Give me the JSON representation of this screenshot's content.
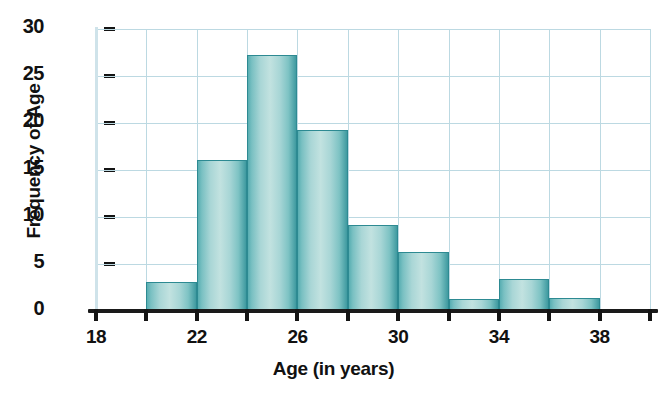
{
  "chart_data": {
    "type": "bar",
    "title": "",
    "subtitle": "",
    "xlabel": "Age (in years)",
    "ylabel": "Frequency of Age",
    "categories": [
      "20-22",
      "22-24",
      "24-26",
      "26-28",
      "28-30",
      "30-32",
      "32-34",
      "34-36",
      "36-38"
    ],
    "bin_starts": [
      20,
      22,
      24,
      26,
      28,
      30,
      32,
      34,
      36
    ],
    "bin_ends": [
      22,
      24,
      26,
      28,
      30,
      32,
      34,
      36,
      38
    ],
    "bin_width": 2,
    "values": [
      3.1,
      16.1,
      27.2,
      19.3,
      9.2,
      6.3,
      1.3,
      3.4,
      1.4
    ],
    "xlim": [
      18,
      40
    ],
    "ylim": [
      0,
      30
    ],
    "xticks": [
      18,
      20,
      22,
      24,
      26,
      28,
      30,
      32,
      34,
      36,
      38,
      40
    ],
    "xtick_labels_shown": [
      "18",
      "22",
      "26",
      "30",
      "34",
      "38"
    ],
    "xtick_labels_values": [
      18,
      22,
      26,
      30,
      34,
      38
    ],
    "yticks": [
      0,
      5,
      10,
      15,
      20,
      25,
      30
    ],
    "ytick_labels": [
      "0",
      "5",
      "10",
      "15",
      "20",
      "25",
      "30"
    ],
    "grid": true,
    "grid_color": "#bcd9e2",
    "legend": null,
    "bar_fill_light": "#c2e2e0",
    "bar_fill_dark": "#3f9aa0",
    "bar_edge_color": "#2d8a92",
    "axis_color": "#141414",
    "background": "#ffffff"
  },
  "axes": {
    "x_title": "Age (in years)",
    "y_title": "Frequency of Age"
  }
}
